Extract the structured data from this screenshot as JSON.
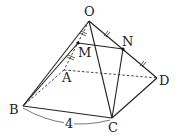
{
  "diagram": {
    "type": "square pyramid O-ABCD",
    "points": {
      "O": {
        "label": "O",
        "x": 89,
        "y": 21
      },
      "A": {
        "label": "A",
        "x": 64,
        "y": 70
      },
      "B": {
        "label": "B",
        "x": 23,
        "y": 106
      },
      "C": {
        "label": "C",
        "x": 112,
        "y": 118
      },
      "D": {
        "label": "D",
        "x": 157,
        "y": 78
      },
      "M": {
        "label": "M",
        "x": 78,
        "y": 43
      },
      "N": {
        "label": "N",
        "x": 123,
        "y": 49
      }
    },
    "solid_edges": [
      "OB",
      "OC",
      "OD",
      "BC",
      "CD",
      "MN",
      "NC",
      "MB"
    ],
    "hidden_edges": [
      "OA",
      "AB",
      "AD"
    ],
    "measurement": {
      "segment": "BC",
      "value": "4"
    },
    "equal_marks": {
      "OM_MA": "double tick",
      "ON_ND": "double tick"
    }
  }
}
